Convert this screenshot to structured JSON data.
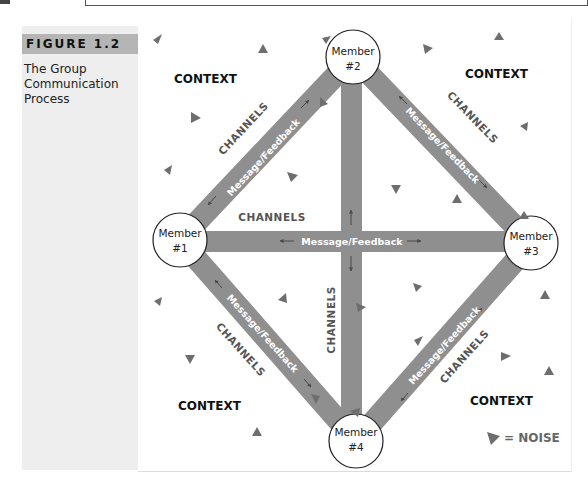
{
  "figure": {
    "label": "FIGURE 1.2",
    "caption": "The Group Communication Process"
  },
  "diagram": {
    "members": [
      {
        "line1": "Member",
        "line2": "#1"
      },
      {
        "line1": "Member",
        "line2": "#2"
      },
      {
        "line1": "Member",
        "line2": "#3"
      },
      {
        "line1": "Member",
        "line2": "#4"
      }
    ],
    "context_labels": [
      "CONTEXT",
      "CONTEXT",
      "CONTEXT",
      "CONTEXT"
    ],
    "channel_label": "CHANNELS",
    "message_label": "Message/Feedback",
    "legend": {
      "text": "= NOISE"
    },
    "colors": {
      "bar": "#8f8f8f",
      "noise": "#6e6e6e",
      "panel": "#eeeeee",
      "figure_tab": "#b5b5b5"
    }
  }
}
